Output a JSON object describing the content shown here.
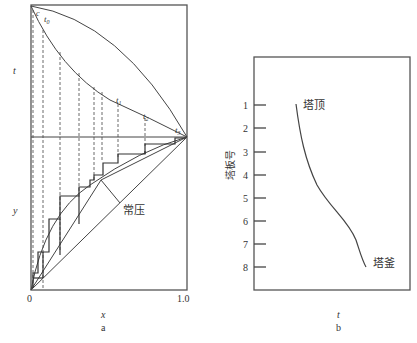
{
  "figure_a": {
    "panel_label": "a",
    "x_axis_label": "x",
    "upper_axis_label": "t",
    "lower_axis_label": "y",
    "x_ticks": [
      "0",
      "1.0"
    ],
    "annotations": {
      "c": "c",
      "t0": "t",
      "t0_sub": "0",
      "t1": "t",
      "t1_sub": "1",
      "t2": "t",
      "t2_sub": "2",
      "t3": "t",
      "t3_sub": "3",
      "pressure_label": "常压"
    }
  },
  "figure_b": {
    "panel_label": "b",
    "x_axis_label": "t",
    "y_axis_label": "塔板号",
    "y_ticks": [
      "1",
      "2",
      "3",
      "4",
      "5",
      "6",
      "7",
      "8"
    ],
    "top_label": "塔顶",
    "bottom_label": "塔釜"
  },
  "colors": {
    "line": "#444444",
    "frame": "#555555",
    "text": "#333333"
  }
}
